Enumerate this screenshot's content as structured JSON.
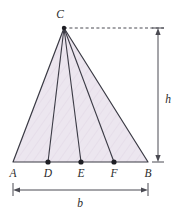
{
  "figure": {
    "type": "geometry-diagram",
    "background_color": "#ffffff",
    "fill_color": "#ece6ef",
    "stroke_color": "#3a3a44",
    "dimension_color": "#4a4a52",
    "label_color": "#2b2b2b"
  },
  "vertices": {
    "C": {
      "label": "C",
      "x": 64,
      "y": 28
    },
    "A": {
      "label": "A",
      "x": 13,
      "y": 162
    },
    "B": {
      "label": "B",
      "x": 148,
      "y": 162
    }
  },
  "base_points": [
    {
      "label": "D",
      "x": 48,
      "y": 162
    },
    {
      "label": "E",
      "x": 81,
      "y": 162
    },
    {
      "label": "F",
      "x": 114,
      "y": 162
    }
  ],
  "vertex_labels": {
    "C": "C",
    "A": "A",
    "B": "B"
  },
  "point_labels": {
    "D": "D",
    "E": "E",
    "F": "F"
  },
  "dimensions": {
    "height": {
      "label": "h",
      "orientation": "vertical",
      "x": 158,
      "from_y": 28,
      "to_y": 162,
      "label_x": 166,
      "label_y": 99
    },
    "base": {
      "label": "b",
      "orientation": "horizontal",
      "y": 190,
      "from_x": 13,
      "to_x": 148,
      "label_x": 80,
      "label_y": 205
    }
  },
  "guide_line": {
    "style": "dashed",
    "from_x": 64,
    "from_y": 28,
    "to_x": 164,
    "to_y": 28
  }
}
